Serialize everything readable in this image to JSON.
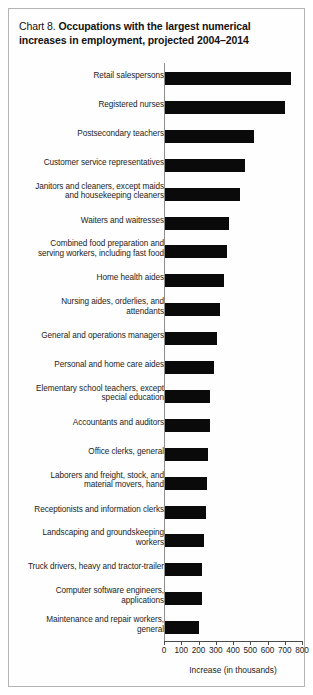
{
  "title": {
    "prefix": "Chart 8.",
    "main": "Occupations with the largest numerical increases in employment, projected 2004–2014"
  },
  "axis": {
    "xlabel": "Increase (in thousands)",
    "ticks": [
      "0",
      "100",
      "200",
      "300",
      "400",
      "500",
      "600",
      "700",
      "800"
    ]
  },
  "chart_data": {
    "type": "bar",
    "orientation": "horizontal",
    "title": "Chart 8. Occupations with the largest numerical increases in employment, projected 2004–2014",
    "xlabel": "Increase (in thousands)",
    "ylabel": "",
    "xlim": [
      0,
      800
    ],
    "grid": false,
    "legend": null,
    "categories": [
      "Retail salespersons",
      "Registered nurses",
      "Postsecondary teachers",
      "Customer service representatives",
      "Janitors and cleaners, except maids\nand housekeeping cleaners",
      "Waiters and waitresses",
      "Combined food preparation and\nserving workers, including fast food",
      "Home health aides",
      "Nursing aides, orderlies, and\nattendants",
      "General and operations managers",
      "Personal and home care aides",
      "Elementary school teachers, except\nspecial education",
      "Accountants and auditors",
      "Office clerks, general",
      "Laborers and freight, stock, and\nmaterial movers, hand",
      "Receptionists and information clerks",
      "Landscaping and groundskeeping\nworkers",
      "Truck drivers, heavy and tractor-trailer",
      "Computer software engineers,\napplications",
      "Maintenance and repair workers,\ngeneral"
    ],
    "values": [
      736,
      703,
      524,
      471,
      440,
      376,
      367,
      350,
      325,
      308,
      287,
      265,
      264,
      256,
      249,
      246,
      230,
      223,
      222,
      202
    ],
    "units": "thousands"
  }
}
